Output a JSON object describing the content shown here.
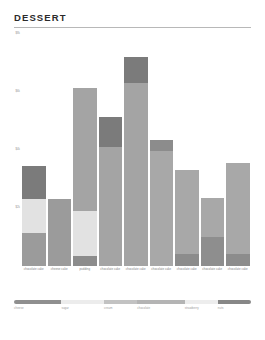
{
  "header": {
    "title": "DESSERT"
  },
  "chart_data": {
    "type": "bar",
    "title": "DESSERT",
    "subtype": "stacked-bar",
    "xlabel": "",
    "ylabel": "",
    "grid": false,
    "legend_position": "bottom",
    "ylim": [
      0,
      8000
    ],
    "ytick_labels": [
      "$8k",
      "$6k",
      "$4k",
      "$2k"
    ],
    "ytick_values": [
      8000,
      6000,
      4000,
      2000
    ],
    "categories": [
      "chocolate cake",
      "cheese cake",
      "pudding",
      "chocolate cake",
      "chocolate cake",
      "chocolate cake",
      "chocolate cake",
      "chocolate cake",
      "chocolate cake"
    ],
    "series": [
      {
        "name": "cheese",
        "color": "#8f8f8f",
        "values": [
          1150,
          2300,
          1250,
          1150,
          4850,
          3850,
          2750,
          1550,
          2500
        ]
      },
      {
        "name": "sugar",
        "color": "#e0e0e0",
        "values": [
          1150,
          0,
          1500,
          0,
          0,
          0,
          0,
          0,
          0
        ]
      },
      {
        "name": "cream",
        "color": "#a8a8a8",
        "values": [
          0,
          0,
          0,
          4500,
          0,
          0,
          0,
          0,
          0
        ]
      },
      {
        "name": "chocolate",
        "color": "#b0b0b0",
        "values": [
          0,
          0,
          4500,
          0,
          0,
          0,
          0,
          1200,
          0
        ]
      },
      {
        "name": "strawberry",
        "color": "#f0f0f0",
        "values": [
          0,
          0,
          0,
          0,
          0,
          0,
          0,
          0,
          0
        ]
      },
      {
        "name": "nuts",
        "color": "#7b7b7b",
        "values": [
          1150,
          0,
          320,
          1000,
          900,
          0,
          450,
          0,
          400
        ]
      }
    ],
    "bars": [
      {
        "label": "chocolate cake",
        "total": 3450,
        "segments": [
          {
            "name": "cheese",
            "color": "#7b7b7b",
            "value": 1150
          },
          {
            "name": "sugar",
            "color": "#e2e2e2",
            "value": 1150
          },
          {
            "name": "cream",
            "color": "#9b9b9b",
            "value": 1150
          }
        ]
      },
      {
        "label": "cheese cake",
        "total": 2300,
        "segments": [
          {
            "name": "cream",
            "color": "#9b9b9b",
            "value": 2300
          }
        ]
      },
      {
        "label": "pudding",
        "total": 6150,
        "segments": [
          {
            "name": "chocolate",
            "color": "#a4a4a4",
            "value": 4250
          },
          {
            "name": "sugar",
            "color": "#e2e2e2",
            "value": 1550
          },
          {
            "name": "nuts",
            "color": "#8c8c8c",
            "value": 350
          }
        ]
      },
      {
        "label": "chocolate cake",
        "total": 5150,
        "segments": [
          {
            "name": "cheese",
            "color": "#7b7b7b",
            "value": 1050
          },
          {
            "name": "cream",
            "color": "#a4a4a4",
            "value": 4100
          }
        ]
      },
      {
        "label": "chocolate cake",
        "total": 7200,
        "segments": [
          {
            "name": "cheese",
            "color": "#7b7b7b",
            "value": 900
          },
          {
            "name": "cream",
            "color": "#a4a4a4",
            "value": 6300
          }
        ]
      },
      {
        "label": "chocolate cake",
        "total": 4350,
        "segments": [
          {
            "name": "cheese",
            "color": "#8c8c8c",
            "value": 400
          },
          {
            "name": "cream",
            "color": "#a8a8a8",
            "value": 3950
          }
        ]
      },
      {
        "label": "chocolate cake",
        "total": 3300,
        "segments": [
          {
            "name": "cream",
            "color": "#a8a8a8",
            "value": 2900
          },
          {
            "name": "nuts",
            "color": "#8c8c8c",
            "value": 400
          }
        ]
      },
      {
        "label": "chocolate cake",
        "total": 2350,
        "segments": [
          {
            "name": "cream",
            "color": "#a8a8a8",
            "value": 1350
          },
          {
            "name": "chocolate",
            "color": "#8e8e8e",
            "value": 1000
          }
        ]
      },
      {
        "label": "chocolate cake",
        "total": 3550,
        "segments": [
          {
            "name": "cream",
            "color": "#a8a8a8",
            "value": 3150
          },
          {
            "name": "nuts",
            "color": "#8c8c8c",
            "value": 400
          }
        ]
      }
    ]
  },
  "legend": {
    "items": [
      {
        "label": "cheese",
        "color": "#8f8f8f",
        "width": 20
      },
      {
        "label": "sugar",
        "color": "#ececec",
        "width": 18
      },
      {
        "label": "cream",
        "color": "#c2c2c2",
        "width": 14
      },
      {
        "label": "chocolate",
        "color": "#b4b4b4",
        "width": 20
      },
      {
        "label": "strawberry",
        "color": "#ededed",
        "width": 14
      },
      {
        "label": "nuts",
        "color": "#878787",
        "width": 14
      }
    ]
  }
}
